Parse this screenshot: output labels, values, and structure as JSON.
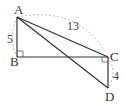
{
  "diagram": {
    "type": "geometry",
    "points": {
      "A": {
        "label": "A",
        "x": 17,
        "y": 17
      },
      "B": {
        "label": "B",
        "x": 17,
        "y": 57
      },
      "C": {
        "label": "C",
        "x": 108,
        "y": 57
      },
      "D": {
        "label": "D",
        "x": 108,
        "y": 88
      }
    },
    "segments": [
      {
        "from": "A",
        "to": "B"
      },
      {
        "from": "B",
        "to": "C"
      },
      {
        "from": "A",
        "to": "C"
      },
      {
        "from": "A",
        "to": "D"
      },
      {
        "from": "C",
        "to": "D"
      }
    ],
    "measurements": {
      "AB": "5",
      "AC": "13",
      "CD": "4"
    },
    "right_angles": [
      "B",
      "C"
    ],
    "colors": {
      "line": "#333333",
      "dashed_arc": "#aaaaaa"
    }
  }
}
